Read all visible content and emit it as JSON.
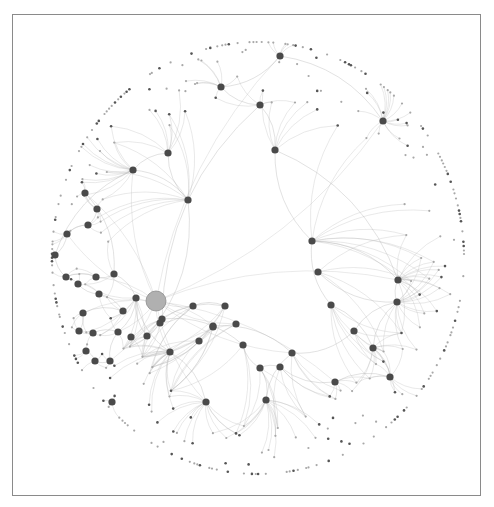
{
  "diagram": {
    "type": "network-graph",
    "layout": "circular-force",
    "colors": {
      "background": "#ffffff",
      "frame": "#8a8a8a",
      "edge": "#b4b4b4",
      "hub": "#4a4a4a",
      "leaf_dark": "#555555",
      "leaf_light": "#a8a8a8",
      "central_node": "#b0b0b0",
      "central_stroke": "#8c8c8c"
    },
    "circle": {
      "cx": 258,
      "cy": 258,
      "rx": 206,
      "ry": 216
    },
    "central_node": {
      "x": 156,
      "y": 301,
      "r": 10
    },
    "hubs": [
      [
        280,
        56
      ],
      [
        221,
        87
      ],
      [
        260,
        105
      ],
      [
        383,
        121
      ],
      [
        275,
        150
      ],
      [
        168,
        153
      ],
      [
        133,
        170
      ],
      [
        188,
        200
      ],
      [
        312,
        241
      ],
      [
        85,
        193
      ],
      [
        97,
        209
      ],
      [
        88,
        225
      ],
      [
        67,
        234
      ],
      [
        55,
        255
      ],
      [
        66,
        277
      ],
      [
        96,
        277
      ],
      [
        114,
        274
      ],
      [
        78,
        284
      ],
      [
        136,
        298
      ],
      [
        99,
        294
      ],
      [
        123,
        311
      ],
      [
        83,
        313
      ],
      [
        79,
        331
      ],
      [
        93,
        333
      ],
      [
        118,
        332
      ],
      [
        147,
        336
      ],
      [
        160,
        323
      ],
      [
        193,
        306
      ],
      [
        225,
        306
      ],
      [
        162,
        319
      ],
      [
        213,
        326
      ],
      [
        199,
        341
      ],
      [
        243,
        345
      ],
      [
        170,
        352
      ],
      [
        213,
        327
      ],
      [
        331,
        305
      ],
      [
        398,
        280
      ],
      [
        397,
        302
      ],
      [
        373,
        348
      ],
      [
        292,
        353
      ],
      [
        260,
        368
      ],
      [
        280,
        367
      ],
      [
        335,
        382
      ],
      [
        390,
        377
      ],
      [
        266,
        400
      ],
      [
        206,
        402
      ],
      [
        86,
        351
      ],
      [
        95,
        361
      ],
      [
        110,
        361
      ],
      [
        112,
        402
      ],
      [
        131,
        337
      ],
      [
        236,
        324
      ],
      [
        318,
        272
      ],
      [
        354,
        331
      ]
    ],
    "hub_links": [
      [
        0,
        1
      ],
      [
        1,
        2
      ],
      [
        2,
        4
      ],
      [
        4,
        8
      ],
      [
        0,
        3
      ],
      [
        5,
        6
      ],
      [
        6,
        7
      ],
      [
        5,
        7
      ],
      [
        7,
        25
      ],
      [
        8,
        35
      ],
      [
        8,
        36
      ],
      [
        36,
        37
      ],
      [
        35,
        38
      ],
      [
        37,
        38
      ],
      [
        38,
        43
      ],
      [
        28,
        29
      ],
      [
        29,
        32
      ],
      [
        32,
        40
      ],
      [
        40,
        41
      ],
      [
        41,
        42
      ],
      [
        42,
        43
      ],
      [
        44,
        40
      ],
      [
        44,
        39
      ],
      [
        45,
        33
      ],
      [
        33,
        18
      ],
      [
        18,
        25
      ],
      [
        25,
        26
      ],
      [
        26,
        27
      ],
      [
        27,
        28
      ],
      [
        9,
        10
      ],
      [
        10,
        11
      ],
      [
        11,
        12
      ],
      [
        12,
        13
      ],
      [
        13,
        14
      ],
      [
        14,
        15
      ],
      [
        15,
        16
      ],
      [
        16,
        18
      ],
      [
        17,
        19
      ],
      [
        19,
        20
      ],
      [
        20,
        21
      ],
      [
        21,
        22
      ],
      [
        22,
        23
      ],
      [
        23,
        24
      ],
      [
        24,
        18
      ],
      [
        46,
        47
      ],
      [
        47,
        48
      ],
      [
        48,
        24
      ],
      [
        6,
        13
      ],
      [
        9,
        16
      ],
      [
        31,
        30
      ],
      [
        30,
        39
      ],
      [
        39,
        53
      ],
      [
        53,
        37
      ],
      [
        2,
        29
      ],
      [
        4,
        36
      ],
      [
        52,
        37
      ]
    ],
    "leaf_count": 330,
    "fans_per_hub": [
      6,
      8,
      5,
      18,
      6,
      8,
      14,
      10,
      10,
      4,
      4,
      4,
      4,
      4,
      4,
      3,
      3,
      3,
      8,
      3,
      3,
      3,
      3,
      3,
      3,
      3,
      3,
      4,
      4,
      3,
      3,
      3,
      3,
      14,
      3,
      6,
      16,
      16,
      10,
      4,
      4,
      4,
      6,
      10,
      14,
      14,
      3,
      3,
      3,
      4,
      3,
      3,
      4,
      4
    ]
  }
}
